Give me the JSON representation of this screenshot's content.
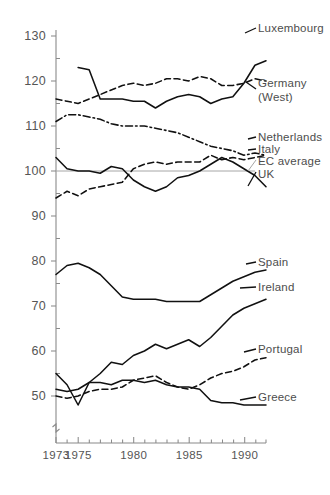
{
  "chart_data": {
    "type": "line",
    "title": "",
    "subtitle": "",
    "xlabel": "",
    "ylabel": "",
    "xlim": [
      1973,
      1992
    ],
    "ylim": [
      45,
      132
    ],
    "grid": false,
    "legend_position": "right-inline-labels",
    "y_axis_break": true,
    "y_ticks": [
      50,
      60,
      70,
      80,
      90,
      100,
      110,
      120,
      130
    ],
    "y_tick_labels": [
      "50",
      "60",
      "70",
      "80",
      "90",
      "100",
      "110",
      "120",
      "130"
    ],
    "x_ticks": [
      1973,
      1975,
      1980,
      1985,
      1990
    ],
    "x_tick_labels": [
      "1973",
      "1975",
      "1980",
      "1985",
      "1990"
    ],
    "x_minor_ticks": [
      1974,
      1976,
      1977,
      1978,
      1979,
      1981,
      1982,
      1983,
      1984,
      1986,
      1987,
      1988,
      1989,
      1991,
      1992
    ],
    "reference_line": {
      "name": "EC average",
      "value": 100,
      "color": "#a6a6a6",
      "style": "solid-thin"
    },
    "series": [
      {
        "name": "Luxembourg",
        "style": "solid",
        "color": "#111111",
        "x": [
          1975,
          1976,
          1977,
          1978,
          1979,
          1980,
          1981,
          1982,
          1983,
          1984,
          1985,
          1986,
          1987,
          1988,
          1989,
          1990,
          1991,
          1992
        ],
        "values": [
          123.0,
          122.5,
          116.0,
          116.0,
          116.0,
          115.5,
          115.5,
          114.0,
          115.5,
          116.5,
          117.0,
          116.5,
          115.0,
          116.0,
          116.5,
          119.5,
          123.5,
          124.5
        ]
      },
      {
        "name": "Germany (West)",
        "style": "dashed",
        "color": "#111111",
        "x": [
          1973,
          1974,
          1975,
          1976,
          1977,
          1978,
          1979,
          1980,
          1981,
          1982,
          1983,
          1984,
          1985,
          1986,
          1987,
          1988,
          1989,
          1990,
          1991,
          1992
        ],
        "values": [
          116.0,
          115.5,
          115.0,
          116.0,
          117.0,
          118.0,
          119.0,
          119.5,
          119.0,
          119.5,
          120.5,
          120.5,
          120.0,
          121.0,
          120.5,
          119.0,
          119.0,
          119.5,
          120.5,
          120.0
        ]
      },
      {
        "name": "Netherlands",
        "style": "dash-dot",
        "color": "#111111",
        "x": [
          1973,
          1974,
          1975,
          1976,
          1977,
          1978,
          1979,
          1980,
          1981,
          1982,
          1983,
          1984,
          1985,
          1986,
          1987,
          1988,
          1989,
          1990,
          1991,
          1992
        ],
        "values": [
          111.0,
          112.5,
          112.5,
          112.0,
          111.5,
          110.5,
          110.0,
          110.0,
          110.0,
          109.5,
          109.0,
          108.5,
          107.5,
          106.5,
          105.5,
          105.0,
          104.5,
          103.5,
          104.0,
          103.5
        ]
      },
      {
        "name": "Italy",
        "style": "dashed",
        "color": "#111111",
        "x": [
          1973,
          1974,
          1975,
          1976,
          1977,
          1978,
          1979,
          1980,
          1981,
          1982,
          1983,
          1984,
          1985,
          1986,
          1987,
          1988,
          1989,
          1990,
          1991,
          1992
        ],
        "values": [
          94.0,
          95.5,
          94.5,
          96.0,
          96.5,
          97.0,
          97.5,
          100.5,
          101.5,
          102.0,
          101.5,
          102.0,
          102.0,
          102.0,
          103.5,
          102.5,
          103.0,
          102.5,
          103.0,
          103.5
        ]
      },
      {
        "name": "UK",
        "style": "solid",
        "color": "#111111",
        "x": [
          1973,
          1974,
          1975,
          1976,
          1977,
          1978,
          1979,
          1980,
          1981,
          1982,
          1983,
          1984,
          1985,
          1986,
          1987,
          1988,
          1989,
          1990,
          1991,
          1992
        ],
        "values": [
          103.0,
          100.5,
          100.0,
          100.0,
          99.5,
          101.0,
          100.5,
          98.0,
          96.5,
          95.5,
          96.5,
          98.5,
          99.0,
          100.0,
          101.5,
          103.0,
          102.0,
          100.5,
          99.0,
          96.5
        ]
      },
      {
        "name": "Spain",
        "style": "solid",
        "color": "#111111",
        "x": [
          1973,
          1974,
          1975,
          1976,
          1977,
          1978,
          1979,
          1980,
          1981,
          1982,
          1983,
          1984,
          1985,
          1986,
          1987,
          1988,
          1989,
          1990,
          1991,
          1992
        ],
        "values": [
          77.0,
          79.0,
          79.5,
          78.5,
          77.0,
          74.5,
          72.0,
          71.5,
          71.5,
          71.5,
          71.0,
          71.0,
          71.0,
          71.0,
          72.5,
          74.0,
          75.5,
          76.5,
          77.5,
          78.0
        ]
      },
      {
        "name": "Ireland",
        "style": "solid",
        "color": "#111111",
        "x": [
          1973,
          1974,
          1975,
          1976,
          1977,
          1978,
          1979,
          1980,
          1981,
          1982,
          1983,
          1984,
          1985,
          1986,
          1987,
          1988,
          1989,
          1990,
          1991,
          1992
        ],
        "values": [
          55.0,
          52.5,
          48.0,
          53.0,
          55.0,
          57.5,
          57.0,
          59.0,
          60.0,
          61.5,
          60.5,
          61.5,
          62.5,
          61.0,
          63.0,
          65.5,
          68.0,
          69.5,
          70.5,
          71.5
        ]
      },
      {
        "name": "Portugal",
        "style": "dashed",
        "color": "#111111",
        "x": [
          1973,
          1974,
          1975,
          1976,
          1977,
          1978,
          1979,
          1980,
          1981,
          1982,
          1983,
          1984,
          1985,
          1986,
          1987,
          1988,
          1989,
          1990,
          1991,
          1992
        ],
        "values": [
          50.0,
          49.5,
          50.0,
          51.0,
          51.5,
          51.5,
          52.0,
          53.5,
          54.0,
          54.5,
          53.0,
          52.0,
          51.5,
          52.5,
          54.0,
          55.0,
          55.5,
          56.5,
          58.0,
          58.5
        ]
      },
      {
        "name": "Greece",
        "style": "solid",
        "color": "#111111",
        "x": [
          1973,
          1974,
          1975,
          1976,
          1977,
          1978,
          1979,
          1980,
          1981,
          1982,
          1983,
          1984,
          1985,
          1986,
          1987,
          1988,
          1989,
          1990,
          1991,
          1992
        ],
        "values": [
          51.5,
          51.0,
          51.5,
          53.0,
          53.0,
          52.5,
          53.5,
          53.5,
          53.0,
          53.5,
          52.5,
          52.0,
          52.0,
          51.5,
          49.0,
          48.5,
          48.5,
          48.0,
          48.0,
          48.0
        ]
      }
    ]
  },
  "labels": {
    "luxembourg": "Luxembourg",
    "germany_line1": "Germany",
    "germany_line2": "(West)",
    "netherlands": "Netherlands",
    "italy": "Italy",
    "ec_average": "EC average",
    "uk": "UK",
    "spain": "Spain",
    "ireland": "Ireland",
    "portugal": "Portugal",
    "greece": "Greece"
  },
  "axis": {
    "y": {
      "t130": "130",
      "t120": "120",
      "t110": "110",
      "t100": "100",
      "t90": "90",
      "t80": "80",
      "t70": "70",
      "t60": "60",
      "t50": "50"
    },
    "x": {
      "t1973": "1973",
      "t1975": "1975",
      "t1980": "1980",
      "t1985": "1985",
      "t1990": "1990"
    }
  },
  "colors": {
    "line": "#111111",
    "reference": "#a6a6a6",
    "axis": "#8a8a8a",
    "text": "#555555",
    "background": "#ffffff"
  }
}
